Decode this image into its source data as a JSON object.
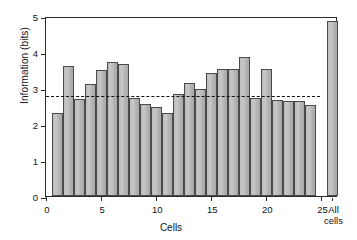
{
  "chart_data": {
    "type": "bar",
    "title": "",
    "xlabel": "Cells",
    "ylabel": "Information (bits)",
    "ylim": [
      0,
      5
    ],
    "yticks": [
      0,
      1,
      2,
      3,
      4,
      5
    ],
    "ytick_labels": [
      "0",
      "1",
      "2",
      "3",
      "4",
      "5"
    ],
    "xlim": [
      0,
      26.5
    ],
    "xticks": [
      0,
      5,
      10,
      15,
      20,
      25
    ],
    "xtick_labels": [
      "0",
      "5",
      "10",
      "15",
      "20",
      "25"
    ],
    "grid": false,
    "legend": null,
    "categories": [
      "1",
      "2",
      "3",
      "4",
      "5",
      "6",
      "7",
      "8",
      "9",
      "10",
      "11",
      "12",
      "13",
      "14",
      "15",
      "16",
      "17",
      "18",
      "19",
      "20",
      "21",
      "22",
      "23",
      "24"
    ],
    "values": [
      2.3,
      3.6,
      2.7,
      3.11,
      3.49,
      3.73,
      3.66,
      2.73,
      2.55,
      2.46,
      2.3,
      2.82,
      3.13,
      2.98,
      3.41,
      3.54,
      3.53,
      3.85,
      2.72,
      3.52,
      2.68,
      2.63,
      2.64,
      2.52
    ],
    "extra_bar": {
      "label": "All cells",
      "label_line1": "All",
      "label_line2": "cells",
      "value": 4.86,
      "x_position": 26.0
    },
    "reference_line": {
      "style": "dashed",
      "value": 2.82,
      "color": "#111111"
    },
    "bar_color": "#b6b6b6",
    "bar_edge_color": "#4a4a4a"
  }
}
